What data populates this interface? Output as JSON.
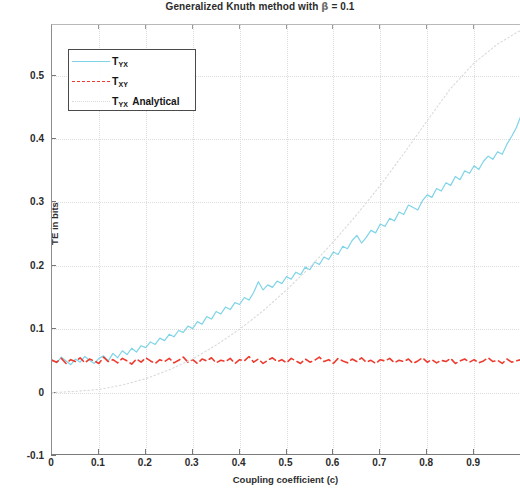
{
  "chart_data": {
    "type": "line",
    "title": "Generalized Knuth method with β = 0.1",
    "title_prefix": "Generalized Knuth method with ",
    "title_symbol": "β",
    "title_suffix": " = 0.1",
    "xlabel": "Coupling coefficient (c)",
    "ylabel": "TE in bits",
    "xlim": [
      0,
      1.0
    ],
    "ylim": [
      -0.1,
      0.58
    ],
    "xticks": [
      0,
      0.1,
      0.2,
      0.3,
      0.4,
      0.5,
      0.6,
      0.7,
      0.8,
      0.9
    ],
    "xtick_labels": [
      "0",
      "0.1",
      "0.2",
      "0.3",
      "0.4",
      "0.5",
      "0.6",
      "0.7",
      "0.8",
      "0.9"
    ],
    "yticks": [
      -0.1,
      0,
      0.1,
      0.2,
      0.3,
      0.4,
      0.5
    ],
    "ytick_labels": [
      "-0.1",
      "0",
      "0.1",
      "0.2",
      "0.3",
      "0.4",
      "0.5"
    ],
    "grid": true,
    "grid_style": "dotted",
    "legend_position": "upper-left",
    "series": [
      {
        "name": "T_YX",
        "label_main": "T",
        "label_sub": "YX",
        "label_tail": "",
        "color": "#7fd4e8",
        "style": "solid",
        "x": [
          0.0,
          0.01,
          0.02,
          0.03,
          0.04,
          0.05,
          0.06,
          0.07,
          0.08,
          0.09,
          0.1,
          0.11,
          0.12,
          0.13,
          0.14,
          0.15,
          0.16,
          0.17,
          0.18,
          0.19,
          0.2,
          0.21,
          0.22,
          0.23,
          0.24,
          0.25,
          0.26,
          0.27,
          0.28,
          0.29,
          0.3,
          0.31,
          0.32,
          0.33,
          0.34,
          0.35,
          0.36,
          0.37,
          0.38,
          0.39,
          0.4,
          0.41,
          0.42,
          0.43,
          0.44,
          0.45,
          0.46,
          0.47,
          0.48,
          0.49,
          0.5,
          0.51,
          0.52,
          0.53,
          0.54,
          0.55,
          0.56,
          0.57,
          0.58,
          0.59,
          0.6,
          0.61,
          0.62,
          0.63,
          0.64,
          0.65,
          0.66,
          0.67,
          0.68,
          0.69,
          0.7,
          0.71,
          0.72,
          0.73,
          0.74,
          0.75,
          0.76,
          0.77,
          0.78,
          0.79,
          0.8,
          0.81,
          0.82,
          0.83,
          0.84,
          0.85,
          0.86,
          0.87,
          0.88,
          0.89,
          0.9,
          0.91,
          0.92,
          0.93,
          0.94,
          0.95,
          0.96,
          0.97,
          0.98,
          0.99,
          1.0
        ],
        "y": [
          0.052,
          0.047,
          0.056,
          0.05,
          0.044,
          0.053,
          0.048,
          0.057,
          0.051,
          0.046,
          0.054,
          0.058,
          0.05,
          0.062,
          0.055,
          0.066,
          0.06,
          0.07,
          0.064,
          0.074,
          0.071,
          0.08,
          0.076,
          0.086,
          0.082,
          0.092,
          0.088,
          0.098,
          0.095,
          0.105,
          0.101,
          0.112,
          0.108,
          0.12,
          0.116,
          0.128,
          0.124,
          0.135,
          0.131,
          0.142,
          0.139,
          0.15,
          0.146,
          0.158,
          0.175,
          0.162,
          0.17,
          0.166,
          0.176,
          0.172,
          0.183,
          0.179,
          0.19,
          0.186,
          0.198,
          0.194,
          0.206,
          0.202,
          0.214,
          0.21,
          0.222,
          0.218,
          0.231,
          0.227,
          0.24,
          0.248,
          0.236,
          0.245,
          0.256,
          0.252,
          0.266,
          0.262,
          0.275,
          0.271,
          0.285,
          0.281,
          0.296,
          0.292,
          0.288,
          0.303,
          0.312,
          0.308,
          0.322,
          0.318,
          0.331,
          0.327,
          0.341,
          0.336,
          0.35,
          0.346,
          0.358,
          0.352,
          0.365,
          0.373,
          0.368,
          0.38,
          0.376,
          0.392,
          0.404,
          0.418,
          0.437
        ]
      },
      {
        "name": "T_XY",
        "label_main": "T",
        "label_sub": "XY",
        "label_tail": "",
        "color": "#ee3b2f",
        "style": "dashed",
        "x": [
          0.0,
          0.01,
          0.02,
          0.03,
          0.04,
          0.05,
          0.06,
          0.07,
          0.08,
          0.09,
          0.1,
          0.11,
          0.12,
          0.13,
          0.14,
          0.15,
          0.16,
          0.17,
          0.18,
          0.19,
          0.2,
          0.21,
          0.22,
          0.23,
          0.24,
          0.25,
          0.26,
          0.27,
          0.28,
          0.29,
          0.3,
          0.31,
          0.32,
          0.33,
          0.34,
          0.35,
          0.36,
          0.37,
          0.38,
          0.39,
          0.4,
          0.41,
          0.42,
          0.43,
          0.44,
          0.45,
          0.46,
          0.47,
          0.48,
          0.49,
          0.5,
          0.51,
          0.52,
          0.53,
          0.54,
          0.55,
          0.56,
          0.57,
          0.58,
          0.59,
          0.6,
          0.61,
          0.62,
          0.63,
          0.64,
          0.65,
          0.66,
          0.67,
          0.68,
          0.69,
          0.7,
          0.71,
          0.72,
          0.73,
          0.74,
          0.75,
          0.76,
          0.77,
          0.78,
          0.79,
          0.8,
          0.81,
          0.82,
          0.83,
          0.84,
          0.85,
          0.86,
          0.87,
          0.88,
          0.89,
          0.9,
          0.91,
          0.92,
          0.93,
          0.94,
          0.95,
          0.96,
          0.97,
          0.98,
          0.99,
          1.0
        ],
        "y": [
          0.051,
          0.048,
          0.054,
          0.046,
          0.052,
          0.049,
          0.055,
          0.047,
          0.053,
          0.05,
          0.046,
          0.056,
          0.049,
          0.052,
          0.047,
          0.054,
          0.05,
          0.045,
          0.053,
          0.048,
          0.055,
          0.05,
          0.046,
          0.052,
          0.049,
          0.054,
          0.047,
          0.051,
          0.056,
          0.048,
          0.052,
          0.046,
          0.053,
          0.05,
          0.055,
          0.047,
          0.051,
          0.049,
          0.054,
          0.046,
          0.052,
          0.05,
          0.057,
          0.048,
          0.053,
          0.046,
          0.051,
          0.055,
          0.049,
          0.052,
          0.047,
          0.054,
          0.05,
          0.046,
          0.053,
          0.048,
          0.051,
          0.056,
          0.049,
          0.052,
          0.046,
          0.054,
          0.05,
          0.047,
          0.053,
          0.049,
          0.055,
          0.048,
          0.051,
          0.046,
          0.052,
          0.05,
          0.054,
          0.047,
          0.051,
          0.049,
          0.053,
          0.046,
          0.05,
          0.055,
          0.048,
          0.052,
          0.047,
          0.051,
          0.049,
          0.054,
          0.046,
          0.05,
          0.053,
          0.048,
          0.052,
          0.047,
          0.05,
          0.055,
          0.049,
          0.051,
          0.046,
          0.053,
          0.048,
          0.05,
          0.052
        ]
      },
      {
        "name": "T_YX Analytical",
        "label_main": "T",
        "label_sub": "YX",
        "label_tail": "Analytical",
        "color": "#d9d9d9",
        "style": "dotted",
        "x": [
          0.0,
          0.05,
          0.1,
          0.15,
          0.2,
          0.25,
          0.3,
          0.35,
          0.4,
          0.45,
          0.5,
          0.55,
          0.6,
          0.65,
          0.7,
          0.75,
          0.8,
          0.85,
          0.9,
          0.95,
          1.0
        ],
        "y": [
          0.0,
          0.002,
          0.005,
          0.012,
          0.022,
          0.036,
          0.053,
          0.075,
          0.1,
          0.129,
          0.162,
          0.198,
          0.238,
          0.281,
          0.327,
          0.377,
          0.429,
          0.48,
          0.52,
          0.55,
          0.572
        ]
      }
    ]
  }
}
